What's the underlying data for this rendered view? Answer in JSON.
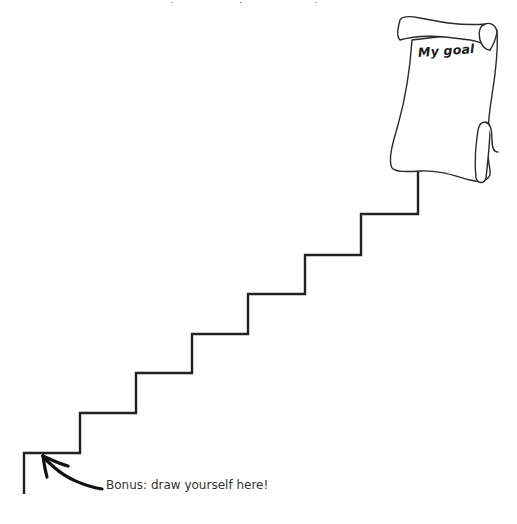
{
  "worksheet": {
    "goal_scroll": {
      "label": "My goal",
      "icon": "scroll-icon"
    },
    "staircase": {
      "steps": 7,
      "icon": "staircase-icon",
      "stroke_color": "#222222"
    },
    "arrow": {
      "icon": "curved-arrow-icon"
    },
    "bonus_label": "Bonus: draw yourself here!",
    "colors": {
      "background": "#ffffff",
      "ink": "#222222",
      "label_text": "#333333"
    }
  }
}
